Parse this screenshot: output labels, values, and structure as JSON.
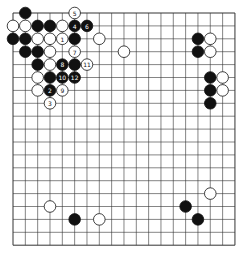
{
  "board": {
    "size": 19,
    "origin": {
      "x": 13,
      "y": 13
    },
    "spacing": {
      "x": 12.33,
      "y": 12.9
    },
    "stone_radius": 5.8,
    "line_color": "#333333",
    "black_color": "#111111",
    "white_color": "#ffffff"
  },
  "stones": [
    {
      "c": 1,
      "r": 0,
      "color": "black"
    },
    {
      "c": 5,
      "r": 0,
      "color": "white",
      "label": "5"
    },
    {
      "c": 0,
      "r": 1,
      "color": "white"
    },
    {
      "c": 1,
      "r": 1,
      "color": "white"
    },
    {
      "c": 2,
      "r": 1,
      "color": "black"
    },
    {
      "c": 3,
      "r": 1,
      "color": "black"
    },
    {
      "c": 4,
      "r": 1,
      "color": "white"
    },
    {
      "c": 5,
      "r": 1,
      "color": "black",
      "label": "4"
    },
    {
      "c": 6,
      "r": 1,
      "color": "black",
      "label": "6"
    },
    {
      "c": 0,
      "r": 2,
      "color": "black"
    },
    {
      "c": 1,
      "r": 2,
      "color": "black"
    },
    {
      "c": 2,
      "r": 2,
      "color": "white"
    },
    {
      "c": 3,
      "r": 2,
      "color": "white"
    },
    {
      "c": 4,
      "r": 2,
      "color": "white",
      "label": "1"
    },
    {
      "c": 5,
      "r": 2,
      "color": "black"
    },
    {
      "c": 7,
      "r": 2,
      "color": "white"
    },
    {
      "c": 1,
      "r": 3,
      "color": "black"
    },
    {
      "c": 2,
      "r": 3,
      "color": "black"
    },
    {
      "c": 3,
      "r": 3,
      "color": "white"
    },
    {
      "c": 5,
      "r": 3,
      "color": "white",
      "label": "7"
    },
    {
      "c": 9,
      "r": 3,
      "color": "white"
    },
    {
      "c": 2,
      "r": 4,
      "color": "black"
    },
    {
      "c": 3,
      "r": 4,
      "color": "white"
    },
    {
      "c": 4,
      "r": 4,
      "color": "black",
      "label": "8"
    },
    {
      "c": 5,
      "r": 4,
      "color": "black"
    },
    {
      "c": 6,
      "r": 4,
      "color": "white",
      "label": "11"
    },
    {
      "c": 2,
      "r": 5,
      "color": "white"
    },
    {
      "c": 3,
      "r": 5,
      "color": "black"
    },
    {
      "c": 4,
      "r": 5,
      "color": "black",
      "label": "10"
    },
    {
      "c": 5,
      "r": 5,
      "color": "black",
      "label": "12"
    },
    {
      "c": 2,
      "r": 6,
      "color": "white"
    },
    {
      "c": 3,
      "r": 6,
      "color": "black",
      "label": "2"
    },
    {
      "c": 4,
      "r": 6,
      "color": "white",
      "label": "9"
    },
    {
      "c": 3,
      "r": 7,
      "color": "white",
      "label": "3"
    },
    {
      "c": 15,
      "r": 2,
      "color": "black"
    },
    {
      "c": 16,
      "r": 2,
      "color": "white"
    },
    {
      "c": 15,
      "r": 3,
      "color": "black"
    },
    {
      "c": 16,
      "r": 3,
      "color": "white"
    },
    {
      "c": 16,
      "r": 5,
      "color": "black"
    },
    {
      "c": 17,
      "r": 5,
      "color": "white"
    },
    {
      "c": 16,
      "r": 6,
      "color": "black"
    },
    {
      "c": 17,
      "r": 6,
      "color": "white"
    },
    {
      "c": 16,
      "r": 7,
      "color": "black"
    },
    {
      "c": 16,
      "r": 14,
      "color": "white"
    },
    {
      "c": 3,
      "r": 15,
      "color": "white"
    },
    {
      "c": 14,
      "r": 15,
      "color": "black"
    },
    {
      "c": 5,
      "r": 16,
      "color": "black"
    },
    {
      "c": 7,
      "r": 16,
      "color": "white"
    },
    {
      "c": 15,
      "r": 16,
      "color": "black"
    }
  ]
}
